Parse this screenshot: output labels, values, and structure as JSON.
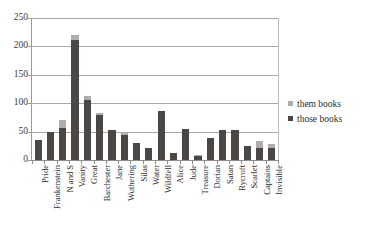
{
  "chart_data": {
    "type": "bar",
    "title": "",
    "subtitle": "",
    "xlabel": "",
    "ylabel": "",
    "ylim": [
      0,
      250
    ],
    "ytick_values": [
      0,
      50,
      100,
      150,
      200,
      250
    ],
    "ytick_labels": [
      "0",
      "50",
      "100",
      "150",
      "200",
      "250"
    ],
    "grid": true,
    "grid_axis": "y",
    "stacked": true,
    "legend_position": "right",
    "categories": [
      "Pride",
      "Frankenstein",
      "N and S",
      "Vanity",
      "Great",
      "Barchester",
      "Jane",
      "Wuthering",
      "Silas",
      "Water",
      "Wildfell",
      "Alice",
      "Jude",
      "Treasure",
      "Dorian",
      "Satan",
      "Rycroft",
      "Scarlet",
      "Captains",
      "Invisible"
    ],
    "series": [
      {
        "name": "those books",
        "color": "#4a4744",
        "values": [
          36,
          50,
          57,
          212,
          106,
          80,
          52,
          44,
          30,
          22,
          87,
          13,
          55,
          7,
          38,
          52,
          52,
          25,
          22,
          21
        ]
      },
      {
        "name": "them books",
        "color": "#b0aeab",
        "values": [
          0,
          0,
          13,
          8,
          6,
          2,
          0,
          6,
          0,
          0,
          0,
          0,
          0,
          2,
          0,
          0,
          0,
          0,
          11,
          8
        ]
      }
    ],
    "totals": [
      36,
      50,
      70,
      220,
      112,
      82,
      52,
      50,
      30,
      22,
      87,
      13,
      55,
      9,
      38,
      52,
      52,
      25,
      33,
      29
    ]
  },
  "legend": {
    "items": [
      {
        "label": "them books",
        "color": "#b0aeab"
      },
      {
        "label": "those books",
        "color": "#4a4744"
      }
    ]
  }
}
